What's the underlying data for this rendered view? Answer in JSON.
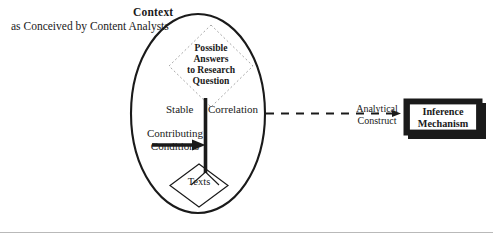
{
  "figure": {
    "header": {
      "title": "Context",
      "subtitle": "as Conceived by Content Analysts"
    },
    "nodes": {
      "possible_answers": "Possible\nAnswers\nto Research\nQuestion",
      "stable": "Stable",
      "correlation": "Correlation",
      "contributing_conditions": "Contributing\nConditions",
      "texts": "Texts",
      "analytical_construct": "Analytical\nConstruct",
      "inference_mechanism": "Inference\nMechanism"
    },
    "colors": {
      "stroke": "#1a1a1a",
      "dotted": "#9a9a9a",
      "background": "#ffffff",
      "baseline_rule": "#b9b9b9"
    }
  }
}
